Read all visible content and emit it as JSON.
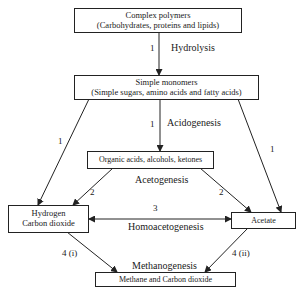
{
  "diagram": {
    "nodes": {
      "complex_polymers": {
        "line1": "Complex polymers",
        "line2": "(Carbohydrates, proteins and lipids)"
      },
      "simple_monomers": {
        "line1": "Simple monomers",
        "line2": "(Simple sugars, amino acids and fatty acids)"
      },
      "organic_acids": {
        "line1": "Organic acids, alcohols, ketones"
      },
      "hydrogen_co2": {
        "line1": "Hydrogen",
        "line2": "Carbon dioxide"
      },
      "acetate": {
        "line1": "Acetate"
      },
      "methane_co2": {
        "line1": "Methane and Carbon dioxide"
      }
    },
    "processes": {
      "hydrolysis": "Hydrolysis",
      "acidogenesis": "Acidogenesis",
      "acetogenesis": "Acetogenesis",
      "homoacetogenesis": "Homoacetogenesis",
      "methanogenesis": "Methanogenesis"
    },
    "step_labels": {
      "hydrolysis": "1",
      "acidogenesis": "1",
      "monomers_to_hydrogen": "1",
      "monomers_to_acetate": "1",
      "acids_to_hydrogen": "2",
      "acids_to_acetate": "2",
      "homoacetogenesis": "3",
      "hydrogen_to_methane": "4 (i)",
      "acetate_to_methane": "4 (ii)"
    },
    "colors": {
      "line": "#222222",
      "background": "#ffffff"
    }
  }
}
